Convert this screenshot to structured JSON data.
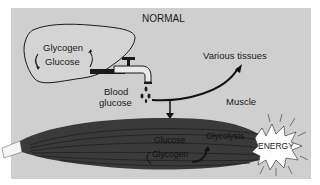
{
  "diagram": {
    "title": "NORMAL",
    "liver": {
      "glycogen_label": "Glycogen",
      "glucose_label": "Glucose"
    },
    "blood_glucose": {
      "line1": "Blood",
      "line2": "glucose"
    },
    "destinations": {
      "various_tissues": "Various tissues",
      "muscle": "Muscle"
    },
    "muscle_internal": {
      "glucose_label": "Glucose",
      "glycogen_label": "Glycogen",
      "glycolysis_label": "Glycolysis"
    },
    "energy_label": "ENERGY",
    "colors": {
      "background": "#cfcfcf",
      "muscle": "#3a3a3a",
      "energy_burst": "#ffffff",
      "lines": "#111111"
    }
  }
}
